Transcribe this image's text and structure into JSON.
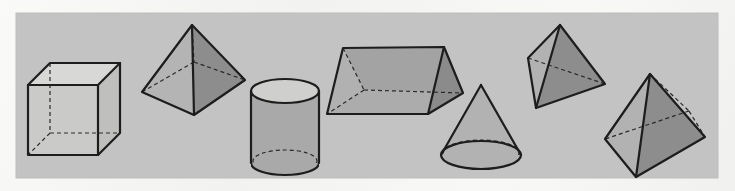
{
  "figure": {
    "panel": {
      "x": 16,
      "y": 13,
      "width": 702,
      "height": 165,
      "fill": "#c3c3c3"
    },
    "page_background": "#f3f3f1",
    "palette": {
      "panel_gray": "#c3c3c3",
      "light_face": "#b9b9b9",
      "mid_face": "#a8a8a8",
      "dark_face": "#8b8b8b",
      "white_face": "#d8d8d6",
      "outline": "#1d1d1d",
      "hidden_edge": "#2a2a2a"
    },
    "stroke": {
      "outline_width": 2.2,
      "hidden_width": 1.2,
      "hidden_dash": "4 3"
    }
  },
  "shapes": [
    {
      "id": "cube",
      "name": "cube",
      "label": "Cube",
      "faces": [
        {
          "id": "cube-top",
          "fill": "#d8d8d6",
          "points": "28,85 50,63 120,63 98,85"
        },
        {
          "id": "cube-front",
          "fill": "#c9c9c7",
          "points": "28,85 98,85 98,155 28,155"
        },
        {
          "id": "cube-right",
          "fill": "#bdbdbb",
          "points": "98,85 120,63 120,133 98,155"
        }
      ],
      "edges": [
        "28,85 50,63",
        "50,63 120,63",
        "120,63 98,85",
        "98,85 28,85",
        "28,85 28,155",
        "28,155 98,155",
        "98,155 98,85",
        "120,63 120,133",
        "120,133 98,155"
      ],
      "hidden_edges": [
        "50,63 50,133",
        "50,133 120,133",
        "50,133 28,155"
      ]
    },
    {
      "id": "square-pyramid-left",
      "name": "square pyramid",
      "label": "Square pyramid",
      "faces": [
        {
          "id": "pyr1-left",
          "fill": "#b4b4b4",
          "points": "192,25 142,92 194,115"
        },
        {
          "id": "pyr1-right",
          "fill": "#8d8d8d",
          "points": "192,25 194,115 245,80"
        }
      ],
      "edges": [
        "192,25 142,92",
        "142,92 194,115",
        "194,115 245,80",
        "245,80 192,25",
        "192,25 194,115"
      ],
      "hidden_edges": [
        "192,25 194,63",
        "194,63 142,92",
        "194,63 245,80"
      ]
    },
    {
      "id": "cylinder",
      "name": "cylinder",
      "label": "Cylinder",
      "geometry": {
        "cx": 285,
        "top_cy": 91,
        "bottom_cy": 163,
        "rx": 34,
        "ry": 12
      },
      "faces": [
        {
          "id": "cyl-body",
          "fill": "#a9a9a9"
        },
        {
          "id": "cyl-top",
          "fill": "#cfcfcd"
        }
      ]
    },
    {
      "id": "triangular-prism",
      "name": "triangular prism",
      "label": "Triangular prism",
      "faces": [
        {
          "id": "prism-top",
          "fill": "#a3a3a3",
          "points": "343,48 444,47 463,93 364,90"
        },
        {
          "id": "prism-front",
          "fill": "#a9a9a9",
          "points": "364,90 463,93 428,114 327,114"
        },
        {
          "id": "prism-right",
          "fill": "#8b8b8b",
          "points": "444,47 463,93 428,114"
        },
        {
          "id": "prism-left",
          "fill": "#b0b0b0",
          "points": "343,48 364,90 327,114"
        }
      ],
      "edges": [
        "343,48 444,47",
        "444,47 463,93",
        "463,93 428,114",
        "428,114 327,114",
        "327,114 343,48",
        "444,47 428,114"
      ],
      "hidden_edges": [
        "343,48 364,90",
        "364,90 463,93",
        "364,90 327,114"
      ]
    },
    {
      "id": "cone",
      "name": "cone",
      "label": "Cone",
      "geometry": {
        "apex_x": 481,
        "apex_y": 85,
        "cx": 481,
        "cy": 155,
        "rx": 40,
        "ry": 14
      },
      "faces": [
        {
          "id": "cone-body",
          "fill": "#b0b0b0"
        },
        {
          "id": "cone-base",
          "fill": "#bdbdbb"
        }
      ]
    },
    {
      "id": "tetrahedron",
      "name": "tetrahedron",
      "label": "Tetrahedron",
      "faces": [
        {
          "id": "tet-left",
          "fill": "#b2b2b2",
          "points": "560,25 528,58 536,108"
        },
        {
          "id": "tet-front",
          "fill": "#8d8d8d",
          "points": "560,25 536,108 605,84"
        }
      ],
      "edges": [
        "560,25 528,58",
        "528,58 536,108",
        "536,108 605,84",
        "605,84 560,25",
        "560,25 536,108"
      ],
      "hidden_edges": [
        "528,58 605,84"
      ]
    },
    {
      "id": "square-pyramid-right",
      "name": "square pyramid",
      "label": "Square pyramid tilted",
      "faces": [
        {
          "id": "pyr2-left",
          "fill": "#b2b2b2",
          "points": "650,74 605,139 636,177"
        },
        {
          "id": "pyr2-right",
          "fill": "#8d8d8d",
          "points": "650,74 636,177 705,137"
        }
      ],
      "edges": [
        "650,74 605,139",
        "605,139 636,177",
        "636,177 705,137",
        "705,137 650,74",
        "650,74 636,177"
      ],
      "hidden_edges": [
        "650,74 689,111",
        "689,111 605,139",
        "689,111 705,137"
      ]
    }
  ]
}
